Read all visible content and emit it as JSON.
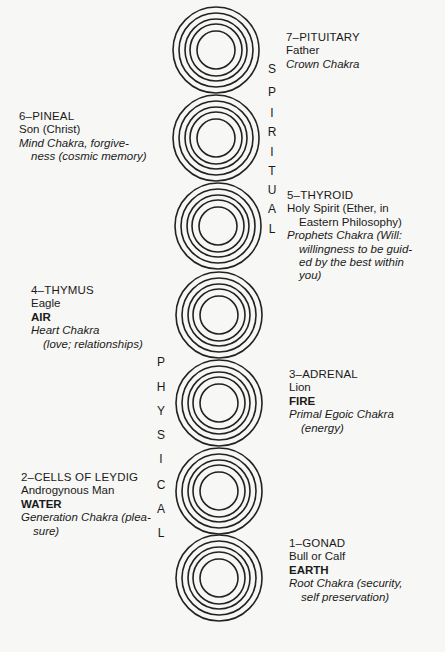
{
  "chakras": [
    {
      "num": "7",
      "gland": "7–PITUITARY",
      "figure": "Father",
      "element": "",
      "chakra_lines": [
        "Crown Chakra"
      ],
      "side": "right"
    },
    {
      "num": "6",
      "gland": "6–PINEAL",
      "figure": "Son (Christ)",
      "element": "",
      "chakra_lines": [
        "Mind Chakra, forgive-",
        "ness (cosmic memory)"
      ],
      "side": "left"
    },
    {
      "num": "5",
      "gland": "5–THYROID",
      "figure_lines": [
        "Holy Spirit (Ether, in",
        "Eastern Philosophy)"
      ],
      "element": "",
      "chakra_lines": [
        "Prophets Chakra (Will:",
        "willingness to be guid-",
        "ed by the best within",
        "you)"
      ],
      "side": "right"
    },
    {
      "num": "4",
      "gland": "4–THYMUS",
      "figure": "Eagle",
      "element": "AIR",
      "chakra_lines": [
        "Heart Chakra",
        "(love; relationships)"
      ],
      "side": "left"
    },
    {
      "num": "3",
      "gland": "3–ADRENAL",
      "figure": "Lion",
      "element": "FIRE",
      "chakra_lines": [
        "Primal Egoic Chakra",
        "(energy)"
      ],
      "side": "right"
    },
    {
      "num": "2",
      "gland": "2–CELLS OF LEYDIG",
      "figure": "Androgynous Man",
      "element": "WATER",
      "chakra_lines": [
        "Generation Chakra (plea-",
        "sure)"
      ],
      "side": "left"
    },
    {
      "num": "1",
      "gland": "1–GONAD",
      "figure": "Bull or Calf",
      "element": "EARTH",
      "chakra_lines": [
        "Root Chakra (security,",
        "self preservation)"
      ],
      "side": "right"
    }
  ],
  "vertical_labels": {
    "spiritual": [
      "S",
      "P",
      "I",
      "R",
      "I",
      "T",
      "U",
      "A",
      "L"
    ],
    "physical": [
      "P",
      "H",
      "Y",
      "S",
      "I",
      "C",
      "A",
      "L"
    ]
  }
}
